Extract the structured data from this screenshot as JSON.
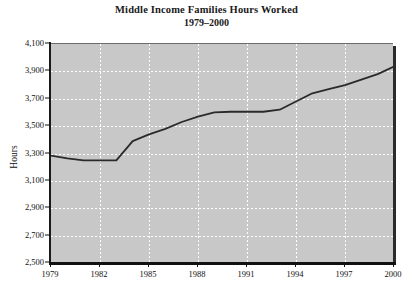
{
  "chart_data": {
    "type": "line",
    "title": "Middle Income Families Hours Worked",
    "subtitle": "1979–2000",
    "xlabel": "",
    "ylabel": "Hours",
    "grid": true,
    "legend": "none",
    "xlim": [
      1979,
      2000
    ],
    "ylim": [
      2500,
      4100
    ],
    "ytick_values": [
      2500,
      2700,
      2900,
      3100,
      3300,
      3500,
      3700,
      3900,
      4100
    ],
    "ytick_labels": [
      "2,500",
      "2,700",
      "2,900",
      "3,100",
      "3,300",
      "3,500",
      "3,700",
      "3,900",
      "4,100"
    ],
    "xtick_values": [
      1979,
      1982,
      1985,
      1988,
      1991,
      1994,
      1997,
      2000
    ],
    "xtick_labels": [
      "1979",
      "1982",
      "1985",
      "1988",
      "1991",
      "1994",
      "1997",
      "2000"
    ],
    "series": [
      {
        "name": "Hours Worked",
        "color": "#2a2a2a",
        "x": [
          1979,
          1980,
          1981,
          1982,
          1983,
          1984,
          1985,
          1986,
          1987,
          1988,
          1989,
          1990,
          1991,
          1992,
          1993,
          1994,
          1995,
          1996,
          1997,
          1998,
          1999,
          2000
        ],
        "values": [
          3285,
          3265,
          3250,
          3250,
          3250,
          3390,
          3440,
          3480,
          3530,
          3570,
          3600,
          3605,
          3605,
          3605,
          3620,
          3680,
          3740,
          3770,
          3800,
          3840,
          3880,
          3935
        ]
      }
    ],
    "colors": {
      "plot_background": "#c8c8c8",
      "gridline": "#ffffff",
      "axis": "#111111",
      "line": "#2a2a2a",
      "page_background": "#ffffff",
      "text": "#111111"
    }
  }
}
